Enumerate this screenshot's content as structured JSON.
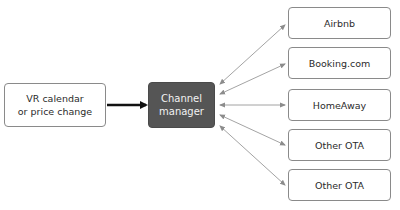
{
  "diagram": {
    "source": {
      "line1": "VR calendar",
      "line2": "or price change"
    },
    "hub": {
      "line1": "Channel",
      "line2": "manager"
    },
    "targets": [
      {
        "label": "Airbnb"
      },
      {
        "label": "Booking.com"
      },
      {
        "label": "HomeAway"
      },
      {
        "label": "Other OTA"
      },
      {
        "label": "Other OTA"
      }
    ],
    "colors": {
      "hub_fill": "#555555",
      "box_border": "#8a8a8a",
      "main_arrow": "#111111",
      "link_arrow": "#8c8c8c"
    }
  }
}
